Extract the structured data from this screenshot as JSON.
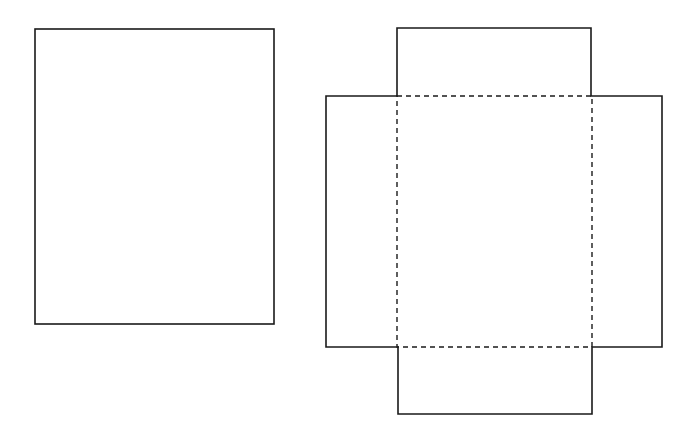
{
  "diagram": {
    "stroke_color": "#1a1a1a",
    "background": "#ffffff",
    "shapes": {
      "plain_rectangle": {
        "x": 35,
        "y": 29,
        "w": 239,
        "h": 295
      },
      "net": {
        "top_flap": {
          "x": 397,
          "y": 28,
          "w": 194,
          "h": 68
        },
        "left_flap": {
          "x": 326,
          "y": 96,
          "w": 71,
          "h": 251
        },
        "right_flap": {
          "x": 592,
          "y": 96,
          "w": 70,
          "h": 251
        },
        "bottom_flap": {
          "x": 398,
          "y": 347,
          "w": 194,
          "h": 67
        },
        "base_fold_lines": {
          "x": 397,
          "y": 96,
          "w": 195,
          "h": 251,
          "style": "dashed"
        }
      }
    }
  }
}
